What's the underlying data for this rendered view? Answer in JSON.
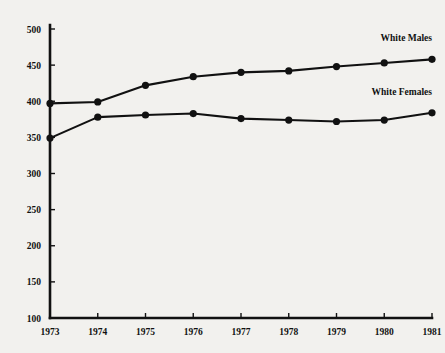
{
  "chart_data": {
    "type": "line",
    "title": "",
    "subtitle": "",
    "xlabel": "",
    "ylabel": "",
    "categories": [
      "1973",
      "1974",
      "1975",
      "1976",
      "1977",
      "1978",
      "1979",
      "1980",
      "1981"
    ],
    "x": [
      1973,
      1974,
      1975,
      1976,
      1977,
      1978,
      1979,
      1980,
      1981
    ],
    "xlim": [
      1973,
      1981
    ],
    "ylim": [
      100,
      500
    ],
    "ytick_labels": [
      "500",
      "450",
      "400",
      "350",
      "300",
      "250",
      "200",
      "150",
      "100"
    ],
    "yticks": [
      500,
      450,
      400,
      350,
      300,
      250,
      200,
      150,
      100
    ],
    "grid": false,
    "legend_position": "inline-right-of-series",
    "marker": "filled-circle",
    "line_color": "#111111",
    "background_color": "#f2f1ee",
    "series": [
      {
        "name": "White Males",
        "label": "White Males",
        "values": [
          397,
          399,
          422,
          434,
          440,
          442,
          448,
          453,
          458
        ]
      },
      {
        "name": "White Females",
        "label": "White Females",
        "values": [
          349,
          378,
          381,
          383,
          376,
          374,
          372,
          374,
          384
        ]
      }
    ]
  }
}
